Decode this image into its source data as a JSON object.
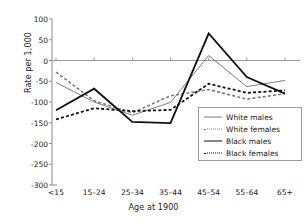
{
  "chart_data": {
    "type": "line",
    "title": "",
    "xlabel": "Age at 1900",
    "ylabel": "Rate per 1,000",
    "categories": [
      "<15",
      "15–24",
      "25–34",
      "35–44",
      "45–54",
      "55–64",
      "65+"
    ],
    "ylim": [
      -300,
      100
    ],
    "yticks": [
      100,
      50,
      0,
      -50,
      -100,
      -150,
      -200,
      -250,
      -300
    ],
    "ytick_labels": [
      "100",
      "50",
      "0",
      "-50",
      "-100",
      "-150",
      "-200",
      "-250",
      "-300"
    ],
    "grid": false,
    "zero_line": true,
    "legend_position": "lower right",
    "series": [
      {
        "name": "White males",
        "color": "#7d7d7d",
        "style": "solid",
        "width": 1,
        "values": [
          -53,
          -100,
          -132,
          -101,
          12,
          -63,
          -48
        ]
      },
      {
        "name": "White females",
        "color": "#7d7d7d",
        "style": "dotted",
        "width": 1.6,
        "values": [
          -28,
          -97,
          -126,
          -85,
          -70,
          -93,
          -80
        ]
      },
      {
        "name": "Black males",
        "color": "#111111",
        "style": "solid",
        "width": 1.8,
        "values": [
          -120,
          -68,
          -148,
          -151,
          65,
          -40,
          -80
        ]
      },
      {
        "name": "Black females",
        "color": "#111111",
        "style": "dotted",
        "width": 1.8,
        "values": [
          -142,
          -115,
          -122,
          -119,
          -56,
          -78,
          -72
        ]
      }
    ]
  },
  "axis": {
    "ylabel": "Rate per 1,000",
    "xlabel": "Age at 1900"
  },
  "legend": {
    "items": [
      {
        "label": "White males"
      },
      {
        "label": "White females"
      },
      {
        "label": "Black males"
      },
      {
        "label": "Black females"
      }
    ]
  }
}
